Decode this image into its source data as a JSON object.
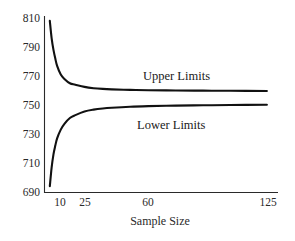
{
  "chart_data": {
    "type": "line",
    "title": "",
    "subtitle": "",
    "xlabel": "Sample Size",
    "ylabel": "",
    "xticks": [
      "10",
      "25",
      "60",
      "125"
    ],
    "xtick_values": [
      10,
      25,
      60,
      125
    ],
    "yticks": [
      "690",
      "710",
      "730",
      "750",
      "770",
      "790",
      "810"
    ],
    "ytick_values": [
      690,
      710,
      730,
      750,
      770,
      790,
      810
    ],
    "ylim": [
      690,
      810
    ],
    "xlim": [
      5,
      130
    ],
    "grid": false,
    "legend_position": "inline-annotations",
    "annotations": [
      {
        "text": "Upper Limits",
        "x": 60,
        "y": 772
      },
      {
        "text": "Lower Limits",
        "x": 57,
        "y": 740
      }
    ],
    "series": [
      {
        "name": "Upper Limits",
        "x": [
          6,
          7,
          8,
          9,
          10,
          12,
          14,
          17,
          20,
          25,
          30,
          35,
          40,
          50,
          60,
          75,
          90,
          105,
          125
        ],
        "values": [
          808,
          796,
          788,
          782,
          777,
          771,
          768,
          765,
          764,
          762.5,
          761.6,
          761.1,
          760.8,
          760.4,
          760.2,
          760.0,
          759.9,
          759.8,
          759.7
        ]
      },
      {
        "name": "Lower Limits",
        "x": [
          6,
          7,
          8,
          9,
          10,
          12,
          14,
          17,
          20,
          25,
          30,
          35,
          40,
          50,
          60,
          75,
          90,
          105,
          125
        ],
        "values": [
          694,
          707,
          716,
          722,
          727,
          733,
          737,
          741,
          743,
          745.5,
          746.8,
          747.6,
          748.1,
          748.8,
          749.2,
          749.6,
          749.8,
          750.0,
          750.2
        ]
      }
    ]
  },
  "axes": {
    "y_axis_name": "value-axis",
    "x_axis_name": "sample-size-axis"
  }
}
